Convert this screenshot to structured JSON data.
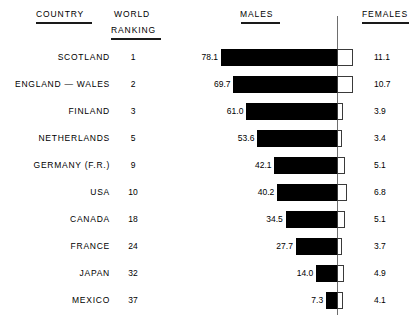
{
  "header": {
    "country": "COUNTRY",
    "world": "WORLD",
    "ranking": "RANKING",
    "males": "MALES",
    "females": "FEMALES"
  },
  "chart_data": {
    "type": "bar",
    "title": "",
    "subtitle": "",
    "orientation": "horizontal-diverging",
    "xlabel": "",
    "ylabel": "",
    "grid": false,
    "legend_position": "top",
    "axis": {
      "center_label": "",
      "note": "Black bars (MALES) extend leftward from the central vertical axis; open/white bars (FEMALES) extend rightward."
    },
    "categories": [
      "SCOTLAND",
      "ENGLAND — WALES",
      "FINLAND",
      "NETHERLANDS",
      "GERMANY (F.R.)",
      "USA",
      "CANADA",
      "FRANCE",
      "JAPAN",
      "MEXICO"
    ],
    "world_ranking": [
      1,
      2,
      3,
      5,
      9,
      10,
      18,
      24,
      32,
      37
    ],
    "series": [
      {
        "name": "MALES",
        "color": "#000000",
        "direction": "left",
        "values": [
          78.1,
          69.7,
          61.0,
          53.6,
          42.1,
          40.2,
          34.5,
          27.7,
          14.0,
          7.3
        ],
        "labels": [
          "78.1",
          "69.7",
          "61.0",
          "53.6",
          "42.1",
          "40.2",
          "34.5",
          "27.7",
          "14.0",
          "7.3"
        ]
      },
      {
        "name": "FEMALES",
        "color": "#ffffff",
        "direction": "right",
        "values": [
          11.1,
          10.7,
          3.9,
          3.4,
          5.1,
          6.8,
          5.1,
          3.7,
          4.9,
          4.1
        ],
        "labels": [
          "11.1",
          "10.7",
          "3.9",
          "3.4",
          "5.1",
          "6.8",
          "5.1",
          "3.7",
          "4.9",
          "4.1"
        ]
      }
    ],
    "xlim": [
      0,
      80
    ],
    "scale_px_per_unit": 1.485
  }
}
